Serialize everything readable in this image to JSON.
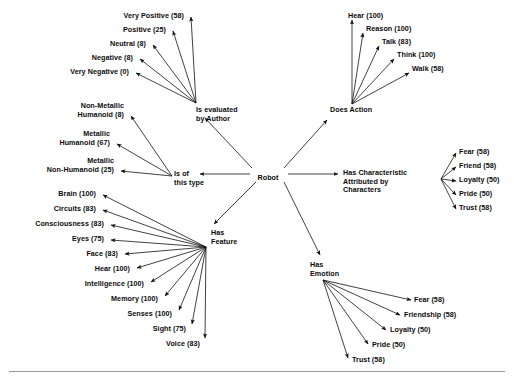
{
  "figure": {
    "center_node": "Robot",
    "ink_color": "#111111",
    "background_color": "#ffffff",
    "rule_color": "#9a9a9a"
  },
  "center": {
    "label": "Robot",
    "x": 268,
    "y": 174
  },
  "relations": [
    {
      "id": "is-evaluated-by-author",
      "label": "Is evaluated\nby Author",
      "x": 196,
      "y": 106,
      "align": "l",
      "hub_x": 196,
      "hub_y": 103
    },
    {
      "id": "does-action",
      "label": "Does Action",
      "x": 330,
      "y": 106,
      "align": "l",
      "hub_x": 352,
      "hub_y": 104
    },
    {
      "id": "is-of-this-type",
      "label": "Is of\nthis type",
      "x": 174,
      "y": 170,
      "align": "l",
      "hub_x": 172,
      "hub_y": 176
    },
    {
      "id": "has-characteristic-attributed-by-characters",
      "label": "Has Characteristic\nAttributed by\nCharacters",
      "x": 343,
      "y": 169,
      "align": "l",
      "hub_x": 441,
      "hub_y": 179
    },
    {
      "id": "has-feature",
      "label": "Has\nFeature",
      "x": 211,
      "y": 229,
      "align": "l",
      "hub_x": 206,
      "hub_y": 247
    },
    {
      "id": "has-emotion",
      "label": "Has\nEmotion",
      "x": 310,
      "y": 261,
      "align": "l",
      "hub_x": 323,
      "hub_y": 280
    }
  ],
  "groups": [
    {
      "id": "author-evaluation",
      "relation": "is-evaluated-by-author",
      "items": [
        {
          "label": "Very Positive (58)",
          "value": 58,
          "x": 184,
          "y": 12,
          "align": "r",
          "tip_x": 191,
          "tip_y": 17
        },
        {
          "label": "Positive (25)",
          "value": 25,
          "x": 166,
          "y": 26,
          "align": "r",
          "tip_x": 173,
          "tip_y": 31
        },
        {
          "label": "Neutral (8)",
          "value": 8,
          "x": 146,
          "y": 40,
          "align": "r",
          "tip_x": 153,
          "tip_y": 45
        },
        {
          "label": "Negative (8)",
          "value": 8,
          "x": 133,
          "y": 54,
          "align": "r",
          "tip_x": 140,
          "tip_y": 59
        },
        {
          "label": "Very Negative (0)",
          "value": 0,
          "x": 129,
          "y": 68,
          "align": "r",
          "tip_x": 136,
          "tip_y": 73
        }
      ]
    },
    {
      "id": "actions",
      "relation": "does-action",
      "items": [
        {
          "label": "Hear (100)",
          "value": 100,
          "x": 348,
          "y": 12,
          "align": "l",
          "tip_x": 352,
          "tip_y": 20
        },
        {
          "label": "Reason (100)",
          "value": 100,
          "x": 366,
          "y": 25,
          "align": "l",
          "tip_x": 363,
          "tip_y": 33
        },
        {
          "label": "Talk (83)",
          "value": 83,
          "x": 382,
          "y": 38,
          "align": "l",
          "tip_x": 379,
          "tip_y": 46
        },
        {
          "label": "Think (100)",
          "value": 100,
          "x": 397,
          "y": 51,
          "align": "l",
          "tip_x": 394,
          "tip_y": 59
        },
        {
          "label": "Walk (58)",
          "value": 58,
          "x": 412,
          "y": 65,
          "align": "l",
          "tip_x": 409,
          "tip_y": 73
        }
      ]
    },
    {
      "id": "robot-types",
      "relation": "is-of-this-type",
      "items": [
        {
          "label": "Non-Metallic\nHumanoid (8)",
          "value": 8,
          "x": 124,
          "y": 102,
          "align": "r",
          "tip_x": 131,
          "tip_y": 116
        },
        {
          "label": "Metallic\nHumanoid (67)",
          "value": 67,
          "x": 110,
          "y": 130,
          "align": "r",
          "tip_x": 117,
          "tip_y": 144
        },
        {
          "label": "Metallic\nNon-Humanoid (25)",
          "value": 25,
          "x": 114,
          "y": 157,
          "align": "r",
          "tip_x": 121,
          "tip_y": 171
        }
      ]
    },
    {
      "id": "character-attributed",
      "relation": "has-characteristic-attributed-by-characters",
      "items": [
        {
          "label": "Fear (58)",
          "value": 58,
          "x": 459,
          "y": 148,
          "align": "l",
          "tip_x": 456,
          "tip_y": 153
        },
        {
          "label": "Friend (58)",
          "value": 58,
          "x": 459,
          "y": 162,
          "align": "l",
          "tip_x": 456,
          "tip_y": 167
        },
        {
          "label": "Loyalty (50)",
          "value": 50,
          "x": 459,
          "y": 176,
          "align": "l",
          "tip_x": 456,
          "tip_y": 181
        },
        {
          "label": "Pride (50)",
          "value": 50,
          "x": 459,
          "y": 190,
          "align": "l",
          "tip_x": 456,
          "tip_y": 195
        },
        {
          "label": "Trust (58)",
          "value": 58,
          "x": 459,
          "y": 204,
          "align": "l",
          "tip_x": 456,
          "tip_y": 209
        }
      ]
    },
    {
      "id": "features",
      "relation": "has-feature",
      "items": [
        {
          "label": "Brain (100)",
          "value": 100,
          "x": 96,
          "y": 190,
          "align": "r",
          "tip_x": 103,
          "tip_y": 195
        },
        {
          "label": "Circuits (83)",
          "value": 83,
          "x": 96,
          "y": 205,
          "align": "r",
          "tip_x": 103,
          "tip_y": 210
        },
        {
          "label": "Consciousness (83)",
          "value": 83,
          "x": 104,
          "y": 220,
          "align": "r",
          "tip_x": 111,
          "tip_y": 225
        },
        {
          "label": "Eyes (75)",
          "value": 75,
          "x": 104,
          "y": 235,
          "align": "r",
          "tip_x": 111,
          "tip_y": 240
        },
        {
          "label": "Face (83)",
          "value": 83,
          "x": 118,
          "y": 250,
          "align": "r",
          "tip_x": 125,
          "tip_y": 254
        },
        {
          "label": "Hear (100)",
          "value": 100,
          "x": 130,
          "y": 265,
          "align": "r",
          "tip_x": 137,
          "tip_y": 268
        },
        {
          "label": "Intelligence (100)",
          "value": 100,
          "x": 144,
          "y": 280,
          "align": "r",
          "tip_x": 151,
          "tip_y": 282
        },
        {
          "label": "Memory (100)",
          "value": 100,
          "x": 158,
          "y": 295,
          "align": "r",
          "tip_x": 165,
          "tip_y": 296
        },
        {
          "label": "Senses (100)",
          "value": 100,
          "x": 172,
          "y": 310,
          "align": "r",
          "tip_x": 179,
          "tip_y": 310
        },
        {
          "label": "Sight (75)",
          "value": 75,
          "x": 186,
          "y": 325,
          "align": "r",
          "tip_x": 192,
          "tip_y": 324
        },
        {
          "label": "Voice (83)",
          "value": 83,
          "x": 200,
          "y": 340,
          "align": "r",
          "tip_x": 205,
          "tip_y": 338
        }
      ]
    },
    {
      "id": "emotions",
      "relation": "has-emotion",
      "items": [
        {
          "label": "Fear (58)",
          "value": 58,
          "x": 414,
          "y": 296,
          "align": "l",
          "tip_x": 411,
          "tip_y": 300
        },
        {
          "label": "Friendship (58)",
          "value": 58,
          "x": 404,
          "y": 311,
          "align": "l",
          "tip_x": 400,
          "tip_y": 315
        },
        {
          "label": "Loyalty (50)",
          "value": 50,
          "x": 390,
          "y": 326,
          "align": "l",
          "tip_x": 386,
          "tip_y": 330
        },
        {
          "label": "Pride (50)",
          "value": 50,
          "x": 372,
          "y": 341,
          "align": "l",
          "tip_x": 368,
          "tip_y": 344
        },
        {
          "label": "Trust (58)",
          "value": 58,
          "x": 352,
          "y": 356,
          "align": "l",
          "tip_x": 348,
          "tip_y": 358
        }
      ]
    }
  ],
  "rule": {
    "y": 371
  }
}
